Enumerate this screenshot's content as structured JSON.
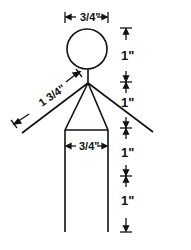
{
  "diagram": {
    "stroke_color": "#111111",
    "background": "#ffffff",
    "dimensions": {
      "head_width": "3/4\"",
      "arm_length": "1 3/4\"",
      "body_width": "3/4\"",
      "vertical_segments": [
        "1\"",
        "1\"",
        "1\"",
        "1\""
      ]
    }
  }
}
